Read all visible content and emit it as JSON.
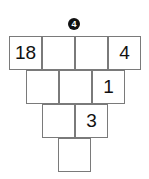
{
  "puzzle": {
    "badge_number": "4",
    "rows": [
      {
        "cells": [
          {
            "value": "18"
          },
          {
            "value": ""
          },
          {
            "value": ""
          },
          {
            "value": "4"
          }
        ]
      },
      {
        "cells": [
          {
            "value": ""
          },
          {
            "value": ""
          },
          {
            "value": "1"
          }
        ]
      },
      {
        "cells": [
          {
            "value": ""
          },
          {
            "value": "3"
          }
        ]
      },
      {
        "cells": [
          {
            "value": ""
          }
        ]
      }
    ]
  },
  "colors": {
    "grid_line": "#7a7a7a",
    "badge_bg": "#111111",
    "badge_text": "#ffffff",
    "number_text": "#111111"
  }
}
